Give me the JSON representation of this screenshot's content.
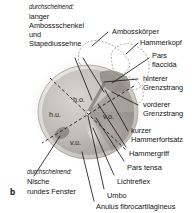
{
  "figure": {
    "letter": "b",
    "caption_left_top": {
      "note": "durchscheinend:",
      "lines": [
        "langer",
        "Ambossschenkel",
        "und",
        "Stapediussehne"
      ]
    },
    "caption_left_bottom": {
      "note": "durchscheinend:",
      "lines": [
        "Nische",
        "rundes Fenster"
      ]
    },
    "labels_right": [
      "Ambossörper",
      "Hammerkopf",
      "Pars",
      "flaccida",
      "hinterer",
      "Grenzstrang",
      "vorderer",
      "Grenzstrang",
      "kurzer",
      "Hammerfortsatz",
      "Hammergriff",
      "Pars tensa",
      "Lichtreflex",
      "Umbo",
      "Anulus fibrocartilagineus"
    ],
    "label_ambosskoerper": "Ambosskörper",
    "label_hammerkopf": "Hammerkopf",
    "label_pars_flaccida_l1": "Pars",
    "label_pars_flaccida_l2": "flaccida",
    "label_hinterer": "hinterer",
    "label_hinterer_grenzstrang": "Grenzstrang",
    "label_vorderer": "vorderer",
    "label_vorderer_grenzstrang": "Grenzstrang",
    "label_kurzer": "kurzer",
    "label_hammerfortsatz": "Hammerfortsatz",
    "label_hammergriff": "Hammergriff",
    "label_pars_tensa": "Pars tensa",
    "label_lichtreflex": "Lichtreflex",
    "label_umbo": "Umbo",
    "label_anulus": "Anulus fibrocartilagineus",
    "quadrants": {
      "ho": "h.o.",
      "hu": "h.u.",
      "vo": "v.o.",
      "vu": "v.u."
    },
    "colors": {
      "text": "#141414",
      "leader_line": "#1a1a1a",
      "membrane_light": "#cfcac4",
      "membrane_mid": "#b5b0aa",
      "membrane_dark": "#9b9690",
      "halo": "#e8e5e1",
      "dashed_outline": "#8e8980"
    }
  }
}
